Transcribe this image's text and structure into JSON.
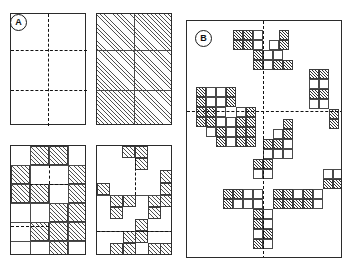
{
  "figure": {
    "title": "",
    "background_color": "#ffffff",
    "line_color": "#2b2b2b",
    "hatch_color": "#4f4f4f",
    "dash_color": "#111111",
    "width": 346,
    "height": 266
  },
  "panels": [
    {
      "id": "A",
      "label": "A",
      "label_shape": "circle",
      "x": 4,
      "y": 6,
      "width": 172,
      "height": 254,
      "subpanels": [
        {
          "id": "A1",
          "name": "empty-grid",
          "x": 10,
          "y": 13,
          "width": 76,
          "height": 112,
          "cols": 2,
          "rows": 3,
          "divider_style": "dashed",
          "filled_cells": []
        },
        {
          "id": "A2",
          "name": "fully-hatched-grid",
          "x": 96,
          "y": 13,
          "width": 76,
          "height": 112,
          "cols": 2,
          "rows": 3,
          "divider_style": "solid",
          "filled_cells": "all"
        },
        {
          "id": "A3",
          "name": "partial-hatched-grid-left",
          "x": 10,
          "y": 145,
          "width": 76,
          "height": 110,
          "cols": 4,
          "rows": 6,
          "divider_style": "mixed",
          "filled_cells": [
            [
              1,
              0
            ],
            [
              2,
              0
            ],
            [
              0,
              1
            ],
            [
              3,
              1
            ],
            [
              0,
              2
            ],
            [
              1,
              2
            ],
            [
              3,
              2
            ],
            [
              2,
              3
            ],
            [
              3,
              3
            ],
            [
              1,
              4
            ],
            [
              2,
              4
            ],
            [
              3,
              4
            ],
            [
              2,
              5
            ]
          ]
        },
        {
          "id": "A4",
          "name": "partial-hatched-grid-right",
          "x": 96,
          "y": 145,
          "width": 76,
          "height": 110,
          "cols": 6,
          "rows": 9,
          "divider_style": "mixed",
          "filled_cells": [
            [
              2,
              0
            ],
            [
              3,
              0
            ],
            [
              3,
              1
            ],
            [
              5,
              2
            ],
            [
              0,
              3
            ],
            [
              5,
              3
            ],
            [
              1,
              4
            ],
            [
              2,
              4
            ],
            [
              4,
              4
            ],
            [
              5,
              4
            ],
            [
              1,
              5
            ],
            [
              4,
              5
            ],
            [
              3,
              6
            ],
            [
              2,
              7
            ],
            [
              3,
              7
            ],
            [
              1,
              8
            ],
            [
              2,
              8
            ],
            [
              4,
              8
            ],
            [
              5,
              8
            ]
          ]
        }
      ]
    },
    {
      "id": "B",
      "label": "B",
      "label_shape": "circle",
      "x": 186,
      "y": 20,
      "width": 156,
      "height": 238,
      "grid": {
        "cols": 16,
        "rows": 24,
        "cell_size": 9.2
      },
      "divider_style": "dashed",
      "filled_cells": [
        [
          5,
          1
        ],
        [
          6,
          1
        ],
        [
          7,
          1
        ],
        [
          10,
          1
        ],
        [
          5,
          2
        ],
        [
          6,
          2
        ],
        [
          10,
          2
        ],
        [
          7,
          3
        ],
        [
          8,
          3
        ],
        [
          9,
          3
        ],
        [
          10,
          3
        ],
        [
          7,
          4
        ],
        [
          8,
          4
        ],
        [
          9,
          4
        ],
        [
          10,
          4
        ],
        [
          13,
          5
        ],
        [
          14,
          5
        ],
        [
          13,
          6
        ],
        [
          14,
          6
        ],
        [
          0,
          7
        ],
        [
          1,
          7
        ],
        [
          2,
          7
        ],
        [
          4,
          7
        ],
        [
          13,
          7
        ],
        [
          14,
          7
        ],
        [
          0,
          8
        ],
        [
          1,
          8
        ],
        [
          4,
          8
        ],
        [
          13,
          8
        ],
        [
          14,
          8
        ],
        [
          0,
          9
        ],
        [
          1,
          9
        ],
        [
          2,
          9
        ],
        [
          5,
          9
        ],
        [
          6,
          9
        ],
        [
          15,
          9
        ],
        [
          0,
          10
        ],
        [
          1,
          10
        ],
        [
          2,
          10
        ],
        [
          3,
          10
        ],
        [
          5,
          10
        ],
        [
          6,
          10
        ],
        [
          15,
          10
        ],
        [
          2,
          11
        ],
        [
          3,
          11
        ],
        [
          5,
          11
        ],
        [
          6,
          11
        ],
        [
          2,
          12
        ],
        [
          3,
          12
        ],
        [
          5,
          12
        ],
        [
          6,
          12
        ],
        [
          8,
          13
        ],
        [
          9,
          13
        ],
        [
          8,
          14
        ],
        [
          9,
          14
        ],
        [
          7,
          15
        ],
        [
          8,
          15
        ],
        [
          6,
          16
        ],
        [
          7,
          16
        ],
        [
          15,
          16
        ],
        [
          6,
          17
        ],
        [
          7,
          17
        ],
        [
          14,
          17
        ],
        [
          15,
          17
        ],
        [
          4,
          18
        ],
        [
          5,
          18
        ],
        [
          6,
          18
        ],
        [
          9,
          18
        ],
        [
          10,
          18
        ],
        [
          11,
          18
        ],
        [
          12,
          18
        ],
        [
          13,
          18
        ],
        [
          4,
          19
        ],
        [
          5,
          19
        ],
        [
          6,
          19
        ],
        [
          9,
          19
        ],
        [
          10,
          19
        ],
        [
          11,
          19
        ],
        [
          12,
          19
        ],
        [
          13,
          19
        ],
        [
          6,
          20
        ],
        [
          7,
          20
        ],
        [
          6,
          21
        ],
        [
          7,
          21
        ],
        [
          6,
          22
        ],
        [
          7,
          22
        ],
        [
          6,
          23
        ],
        [
          7,
          23
        ]
      ]
    }
  ]
}
